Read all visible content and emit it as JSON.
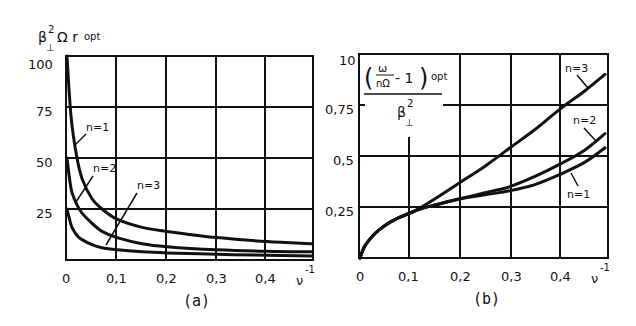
{
  "chart_data": [
    {
      "panel": "(a)",
      "type": "line",
      "ylabel": "β⊥² Ω r opt",
      "xlabel": "ν⁻¹",
      "x_ticks": [
        "0",
        "0,1",
        "0,2",
        "0,3",
        "0,4"
      ],
      "y_ticks": [
        "25",
        "50",
        "75",
        "100"
      ],
      "xlim": [
        0,
        0.49
      ],
      "ylim": [
        0,
        100
      ],
      "grid": true,
      "series": [
        {
          "name": "n=1",
          "x": [
            0,
            0.005,
            0.01,
            0.02,
            0.03,
            0.05,
            0.07,
            0.1,
            0.15,
            0.2,
            0.3,
            0.4,
            0.49
          ],
          "values": [
            100,
            80,
            66,
            50,
            40,
            30,
            25,
            20,
            16,
            14,
            11,
            9,
            8
          ]
        },
        {
          "name": "n=2",
          "x": [
            0,
            0.005,
            0.01,
            0.02,
            0.03,
            0.05,
            0.07,
            0.1,
            0.15,
            0.2,
            0.3,
            0.4,
            0.49
          ],
          "values": [
            50,
            40,
            33,
            27,
            23,
            18,
            14,
            11,
            8,
            6.5,
            5,
            4.3,
            4
          ]
        },
        {
          "name": "n=3",
          "x": [
            0,
            0.005,
            0.01,
            0.02,
            0.03,
            0.05,
            0.07,
            0.1,
            0.15,
            0.2,
            0.3,
            0.4,
            0.49
          ],
          "values": [
            25,
            20,
            16,
            12,
            10,
            7.5,
            6,
            5,
            4,
            3.5,
            2.8,
            2.3,
            2
          ]
        }
      ],
      "annotations": [
        "n=1",
        "n=2",
        "n=3"
      ],
      "caption": "(a)"
    },
    {
      "panel": "(b)",
      "type": "line",
      "ylabel": "(ω/nΩ − 1) opt / β⊥²",
      "xlabel": "ν⁻¹",
      "x_ticks": [
        "0",
        "0,1",
        "0,2",
        "0,3",
        "0,4"
      ],
      "y_ticks": [
        "0,25",
        "0,5",
        "0,75",
        "10"
      ],
      "xlim": [
        0,
        0.49
      ],
      "ylim": [
        0,
        1.0
      ],
      "grid": true,
      "series": [
        {
          "name": "n=1",
          "x": [
            0,
            0.01,
            0.03,
            0.05,
            0.08,
            0.1,
            0.12,
            0.15,
            0.2,
            0.25,
            0.3,
            0.35,
            0.4,
            0.45,
            0.49
          ],
          "values": [
            0,
            0.06,
            0.12,
            0.16,
            0.2,
            0.22,
            0.24,
            0.26,
            0.29,
            0.31,
            0.33,
            0.36,
            0.41,
            0.47,
            0.54
          ]
        },
        {
          "name": "n=2",
          "x": [
            0,
            0.01,
            0.03,
            0.05,
            0.08,
            0.1,
            0.12,
            0.15,
            0.2,
            0.25,
            0.3,
            0.35,
            0.4,
            0.45,
            0.49
          ],
          "values": [
            0,
            0.06,
            0.12,
            0.16,
            0.2,
            0.22,
            0.24,
            0.26,
            0.29,
            0.32,
            0.35,
            0.4,
            0.46,
            0.53,
            0.61
          ]
        },
        {
          "name": "n=3",
          "x": [
            0,
            0.01,
            0.03,
            0.05,
            0.08,
            0.1,
            0.12,
            0.15,
            0.2,
            0.25,
            0.3,
            0.35,
            0.4,
            0.45,
            0.49
          ],
          "values": [
            0,
            0.06,
            0.12,
            0.16,
            0.2,
            0.22,
            0.245,
            0.29,
            0.37,
            0.45,
            0.54,
            0.63,
            0.73,
            0.82,
            0.9
          ]
        }
      ],
      "annotations": [
        "n=1",
        "n=2",
        "n=3"
      ],
      "caption": "(b)"
    }
  ],
  "panel_a": {
    "ylabel_main": "β",
    "ylabel_sup": "2",
    "ylabel_sub": "⊥",
    "ylabel_rest": "Ω r",
    "ylabel_opt": "opt",
    "yticks": {
      "t100": "100",
      "t75": "75",
      "t50": "50",
      "t25": "25"
    },
    "xticks": {
      "t0": "0",
      "t1": "0,1",
      "t2": "0,2",
      "t3": "0,3",
      "t4": "0,4"
    },
    "xlabel_main": "ν",
    "xlabel_sup": "-1",
    "labels": {
      "n1": "n=1",
      "n2": "n=2",
      "n3": "n=3"
    },
    "caption": "(a)"
  },
  "panel_b": {
    "num_open": "(",
    "num_close": ")",
    "omega": "ω",
    "n_omega": "nΩ",
    "minus_one": "- 1",
    "opt": "opt",
    "den_main": "β",
    "den_sup": "2",
    "den_sub": "⊥",
    "yticks": {
      "t10": "10",
      "t75": "0,75",
      "t50": "0,5",
      "t25": "0,25"
    },
    "xticks": {
      "t0": "0",
      "t1": "0,1",
      "t2": "0,2",
      "t3": "0,3",
      "t4": "0,4"
    },
    "xlabel_main": "ν",
    "xlabel_sup": "-1",
    "labels": {
      "n1": "n=1",
      "n2": "n=2",
      "n3": "n=3"
    },
    "caption": "(b)"
  }
}
